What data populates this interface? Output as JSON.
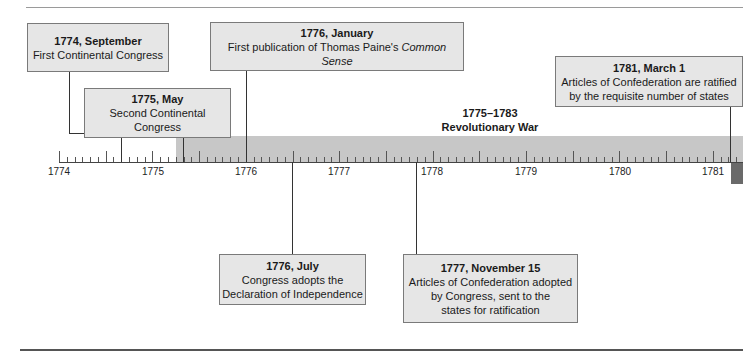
{
  "timeline": {
    "title_range": "1775–1783",
    "war_label": "Revolutionary War",
    "years": [
      "1774",
      "1775",
      "1776",
      "1777",
      "1778",
      "1779",
      "1780",
      "1781"
    ],
    "events_above": [
      {
        "date": "1774, September",
        "desc": "First Continental Congress"
      },
      {
        "date": "1775, May",
        "desc": "Second Continental Congress"
      },
      {
        "date": "1776, January",
        "desc_prefix": "First publication of Thomas Paine's ",
        "desc_italic": "Common Sense"
      },
      {
        "date": "1781, March 1",
        "desc_line1": "Articles of Confederation are ratified",
        "desc_line2": "by the requisite number of states"
      }
    ],
    "events_below": [
      {
        "date": "1776, July",
        "desc_line1": "Congress adopts the",
        "desc_line2": "Declaration of Independence"
      },
      {
        "date": "1777, November 15",
        "desc_line1": "Articles of Confederation adopted",
        "desc_line2": "by Congress, sent to the",
        "desc_line3": "states for ratification"
      }
    ]
  },
  "colors": {
    "box_fill": "#e6e6e6",
    "war_bar": "#c7c7c7",
    "war_bar_end": "#6a6a6a"
  }
}
